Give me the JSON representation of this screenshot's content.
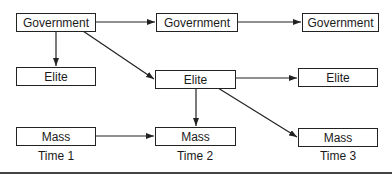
{
  "diagram": {
    "nodes": {
      "gov1": "Government",
      "gov2": "Government",
      "gov3": "Government",
      "elite1": "Elite",
      "elite2": "Elite",
      "elite3": "Elite",
      "mass1": "Mass",
      "mass2": "Mass",
      "mass3": "Mass"
    },
    "time_labels": [
      "Time 1",
      "Time 2",
      "Time 3"
    ],
    "edges": [
      {
        "from": "gov1",
        "to": "gov2"
      },
      {
        "from": "gov2",
        "to": "gov3"
      },
      {
        "from": "gov1",
        "to": "elite1"
      },
      {
        "from": "gov1",
        "to": "elite2"
      },
      {
        "from": "elite2",
        "to": "elite3"
      },
      {
        "from": "elite2",
        "to": "mass2"
      },
      {
        "from": "elite2",
        "to": "mass3"
      },
      {
        "from": "mass1",
        "to": "mass2"
      }
    ]
  }
}
